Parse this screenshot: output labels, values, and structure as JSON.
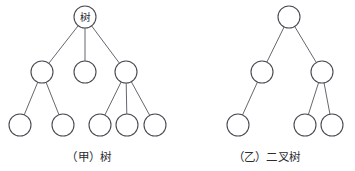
{
  "figure": {
    "background_color": "#ffffff",
    "node_stroke_color": "#4a4a52",
    "edge_stroke_color": "#55555d",
    "text_color": "#2b2b30",
    "diagrams": [
      {
        "id": "tree-general",
        "caption": "（甲）树",
        "caption_label": "（甲）",
        "caption_name": "树",
        "node_count": 9,
        "nodes": [
          {
            "id": "a0",
            "label": "树",
            "cx": 85,
            "cy": 17,
            "r": 11,
            "level": 0
          },
          {
            "id": "a1",
            "label": "",
            "cx": 42,
            "cy": 72,
            "r": 11,
            "level": 1
          },
          {
            "id": "a2",
            "label": "",
            "cx": 85,
            "cy": 72,
            "r": 11,
            "level": 1
          },
          {
            "id": "a3",
            "label": "",
            "cx": 126,
            "cy": 72,
            "r": 11,
            "level": 1
          },
          {
            "id": "a4",
            "label": "",
            "cx": 20,
            "cy": 125,
            "r": 11,
            "level": 2
          },
          {
            "id": "a5",
            "label": "",
            "cx": 63,
            "cy": 125,
            "r": 11,
            "level": 2
          },
          {
            "id": "a6",
            "label": "",
            "cx": 100,
            "cy": 125,
            "r": 11,
            "level": 2
          },
          {
            "id": "a7",
            "label": "",
            "cx": 127,
            "cy": 125,
            "r": 11,
            "level": 2
          },
          {
            "id": "a8",
            "label": "",
            "cx": 155,
            "cy": 125,
            "r": 11,
            "level": 2
          }
        ],
        "edges": [
          {
            "from": "a0",
            "to": "a1"
          },
          {
            "from": "a0",
            "to": "a2"
          },
          {
            "from": "a0",
            "to": "a3"
          },
          {
            "from": "a1",
            "to": "a4"
          },
          {
            "from": "a1",
            "to": "a5"
          },
          {
            "from": "a3",
            "to": "a6"
          },
          {
            "from": "a3",
            "to": "a7"
          },
          {
            "from": "a3",
            "to": "a8"
          }
        ]
      },
      {
        "id": "tree-binary",
        "caption": "（乙）二叉树",
        "caption_label": "（乙）",
        "caption_name": "二叉树",
        "node_count": 6,
        "nodes": [
          {
            "id": "b0",
            "label": "",
            "cx": 289,
            "cy": 17,
            "r": 11,
            "level": 0
          },
          {
            "id": "b1",
            "label": "",
            "cx": 262,
            "cy": 72,
            "r": 11,
            "level": 1
          },
          {
            "id": "b2",
            "label": "",
            "cx": 322,
            "cy": 72,
            "r": 11,
            "level": 1
          },
          {
            "id": "b3",
            "label": "",
            "cx": 238,
            "cy": 125,
            "r": 11,
            "level": 2
          },
          {
            "id": "b4",
            "label": "",
            "cx": 305,
            "cy": 125,
            "r": 11,
            "level": 2
          },
          {
            "id": "b5",
            "label": "",
            "cx": 332,
            "cy": 125,
            "r": 11,
            "level": 2
          }
        ],
        "edges": [
          {
            "from": "b0",
            "to": "b1"
          },
          {
            "from": "b0",
            "to": "b2"
          },
          {
            "from": "b1",
            "to": "b3"
          },
          {
            "from": "b2",
            "to": "b4"
          },
          {
            "from": "b2",
            "to": "b5"
          }
        ]
      }
    ]
  }
}
